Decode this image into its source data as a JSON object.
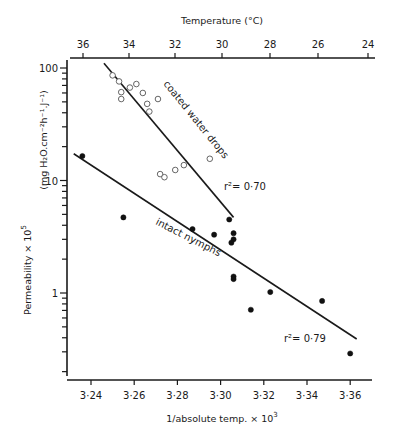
{
  "chart_data": {
    "type": "scatter",
    "title": "",
    "xlabel": "1/absolute temp. × 10³",
    "ylabel": "Permeability × 10⁵",
    "ylabel_units": "(mg H₂O.cm⁻²h⁻¹.J⁻¹)",
    "top_xlabel": "Temperature (°C)",
    "xlim": [
      3.234,
      3.365
    ],
    "ylim": [
      0.19,
      110
    ],
    "yscale": "log",
    "grid": false,
    "x_ticks": [
      "3·24",
      "3·26",
      "3·28",
      "3·30",
      "3·32",
      "3·34",
      "3·36"
    ],
    "x_tick_values": [
      3.24,
      3.26,
      3.28,
      3.3,
      3.32,
      3.34,
      3.36
    ],
    "top_x_ticks": [
      "36",
      "34",
      "32",
      "30",
      "28",
      "26",
      "24"
    ],
    "y_ticks": [
      "100",
      "10",
      "1"
    ],
    "y_tick_values": [
      100,
      10,
      1
    ],
    "series": [
      {
        "name": "coated water drops",
        "marker": "open-circle",
        "r2": "r²= 0·70",
        "points": [
          [
            3.25,
            86
          ],
          [
            3.253,
            76
          ],
          [
            3.254,
            61
          ],
          [
            3.254,
            53
          ],
          [
            3.258,
            67
          ],
          [
            3.261,
            72
          ],
          [
            3.264,
            60
          ],
          [
            3.266,
            48
          ],
          [
            3.267,
            41
          ],
          [
            3.271,
            53
          ],
          [
            3.272,
            11.4
          ],
          [
            3.274,
            10.7
          ],
          [
            3.279,
            12.4
          ],
          [
            3.283,
            13.7
          ],
          [
            3.295,
            15.6
          ]
        ],
        "fit_line": [
          [
            3.246,
            110
          ],
          [
            3.306,
            4.7
          ]
        ]
      },
      {
        "name": "intact nymphs",
        "marker": "filled-circle",
        "r2": "r²= 0·79",
        "points": [
          [
            3.236,
            16.5
          ],
          [
            3.255,
            4.7
          ],
          [
            3.287,
            3.7
          ],
          [
            3.297,
            3.3
          ],
          [
            3.304,
            4.5
          ],
          [
            3.306,
            3.4
          ],
          [
            3.306,
            3.0
          ],
          [
            3.305,
            2.8
          ],
          [
            3.306,
            1.4
          ],
          [
            3.306,
            1.33
          ],
          [
            3.314,
            0.71
          ],
          [
            3.323,
            1.02
          ],
          [
            3.347,
            0.85
          ],
          [
            3.36,
            0.29
          ]
        ],
        "fit_line": [
          [
            3.232,
            17.3
          ],
          [
            3.363,
            0.39
          ]
        ]
      }
    ]
  },
  "labels": {
    "top_axis_title": "Temperature (°C)",
    "bottom_axis_title": "1/absolute temp. × 10",
    "bottom_axis_exp": "3",
    "y_title_main": "Permeability × 10",
    "y_title_exp": "5",
    "y_units": "(mg H₂O.cm⁻²h⁻¹.J⁻¹)",
    "coated_label": "coated water drops",
    "intact_label": "intact nymphs",
    "r2_coated": "r²= 0·70",
    "r2_intact": "r²= 0·79"
  }
}
